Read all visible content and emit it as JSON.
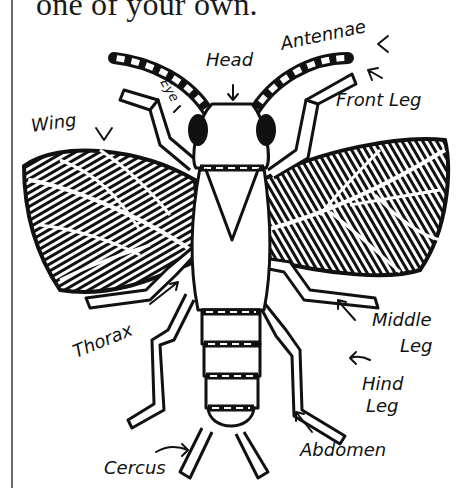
{
  "intro": {
    "text": "one of your own."
  },
  "diagram": {
    "labels": {
      "antennae": "Antennae",
      "head": "Head",
      "eye": "Eye",
      "front_leg": "Front Leg",
      "wing": "Wing",
      "thorax": "Thorax",
      "middle_leg_1": "Middle",
      "middle_leg_2": "Leg",
      "hind_leg_1": "Hind",
      "hind_leg_2": "Leg",
      "abdomen": "Abdomen",
      "cercus": "Cercus"
    },
    "colors": {
      "ink": "#111111",
      "paper": "#ffffff",
      "margin_line": "#6a6a6a"
    }
  }
}
